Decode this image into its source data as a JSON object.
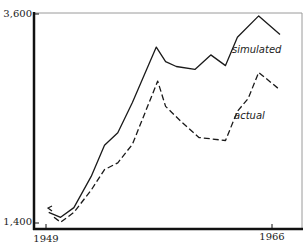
{
  "chart_data": {
    "type": "line",
    "title": "",
    "xlabel": "",
    "ylabel": "",
    "xlim": [
      1949,
      1966
    ],
    "ylim": [
      1400,
      3600
    ],
    "grid": false,
    "legend": "inline labels",
    "x_ticks": [
      "1949",
      "1966"
    ],
    "y_ticks": [
      "1,400",
      "3,600"
    ],
    "series": [
      {
        "name": "simulated",
        "style": "solid",
        "x": [
          1949.2,
          1950.1,
          1951.1,
          1952.4,
          1953.4,
          1954.4,
          1955.5,
          1957.3,
          1958.0,
          1958.8,
          1960.2,
          1961.4,
          1962.5,
          1963.4,
          1965.0,
          1966.6
        ],
        "values": [
          1560,
          1510,
          1610,
          1930,
          2250,
          2380,
          2690,
          3260,
          3110,
          3060,
          3030,
          3180,
          3070,
          3360,
          3580,
          3390
        ]
      },
      {
        "name": "actual",
        "style": "dashed",
        "x": [
          1949.6,
          1950.1,
          1951.1,
          1952.4,
          1953.4,
          1954.4,
          1955.5,
          1957.4,
          1958.0,
          1959.2,
          1960.5,
          1962.5,
          1963.4,
          1964.2,
          1965.0,
          1966.6
        ],
        "values": [
          1510,
          1460,
          1560,
          1790,
          2000,
          2070,
          2260,
          2910,
          2650,
          2490,
          2330,
          2300,
          2600,
          2730,
          3000,
          2820
        ]
      }
    ],
    "annotations": [
      {
        "text": "simulated",
        "near_series": "simulated"
      },
      {
        "text": "actual",
        "near_series": "actual"
      }
    ]
  },
  "labels": {
    "y_top": "3,600",
    "y_bottom": "1,400",
    "x_left": "1949",
    "x_right": "1966",
    "simulated": "simulated",
    "actual": "actual"
  },
  "plot": {
    "x_px": [
      34,
      302
    ],
    "y_px": [
      14,
      228
    ],
    "axis_color": "#111111",
    "frame_color": "#9a9a9a",
    "line_color": "#1a1a1a"
  }
}
